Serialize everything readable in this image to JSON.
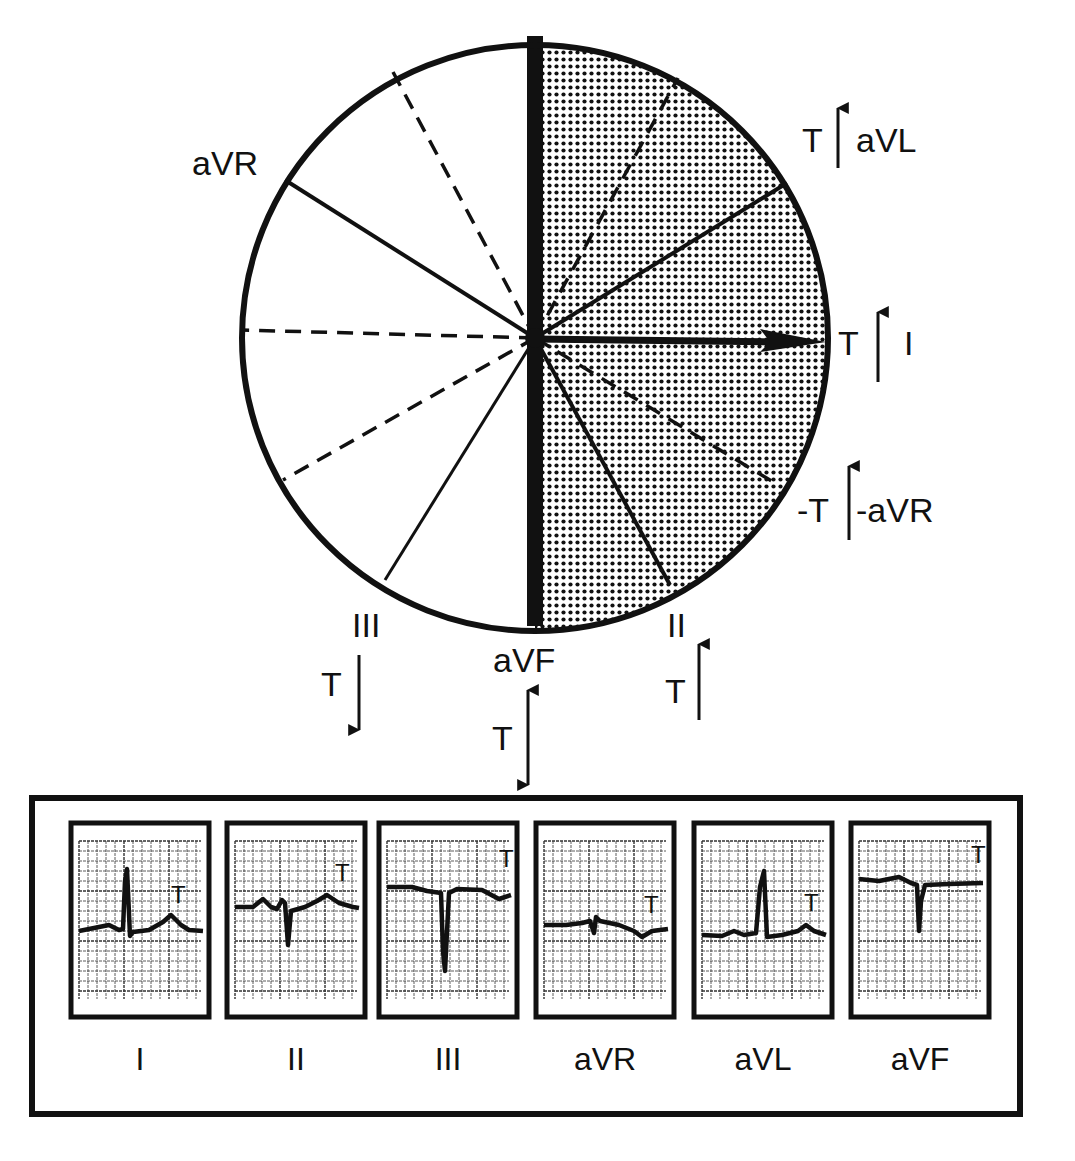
{
  "diagram": {
    "colors": {
      "ink": "#111111",
      "paper": "#ffffff",
      "shade_dot": "#111111"
    },
    "circle": {
      "cx": 535,
      "cy": 338,
      "r": 293
    },
    "shaded_half": "right",
    "axis_arrow": {
      "label": "T axis",
      "direction_deg": 0
    },
    "lead_lines": [
      {
        "name": "aVR",
        "style": "solid",
        "x": 285,
        "y": 180
      },
      {
        "name": "aVL",
        "style": "solid",
        "x": 787,
        "y": 183
      },
      {
        "name": "III",
        "style": "solid",
        "x": 385,
        "y": 580
      },
      {
        "name": "II",
        "style": "solid",
        "x": 670,
        "y": 585
      },
      {
        "name": "dash-upper-left",
        "style": "dashed",
        "x": 393,
        "y": 72
      },
      {
        "name": "dash-upper-right",
        "style": "dashed",
        "x": 678,
        "y": 78
      },
      {
        "name": "dash-left",
        "style": "dashed",
        "x": 242,
        "y": 330
      },
      {
        "name": "dash-lower-left",
        "style": "dashed",
        "x": 283,
        "y": 480
      },
      {
        "name": "dash-lower-right",
        "style": "dashed",
        "x": 778,
        "y": 485
      }
    ],
    "labels": {
      "aVR": "aVR",
      "aVL": "aVL",
      "I": "I",
      "neg_aVR": "-aVR",
      "II": "II",
      "III": "III",
      "aVF": "aVF",
      "T": "T",
      "neg_T": "-T"
    },
    "t_indicators": [
      {
        "lead": "aVL",
        "t_label": "T",
        "arrow": "up"
      },
      {
        "lead": "I",
        "t_label": "T",
        "arrow": "up"
      },
      {
        "lead": "-aVR",
        "t_label": "-T",
        "arrow": "up"
      },
      {
        "lead": "II",
        "t_label": "T",
        "arrow": "up"
      },
      {
        "lead": "aVF",
        "t_label": "T",
        "arrow": "both"
      },
      {
        "lead": "III",
        "t_label": "T",
        "arrow": "down"
      }
    ]
  },
  "strips": {
    "t_marker": "T",
    "items": [
      {
        "label": "I",
        "x": 71,
        "qrs": "upright",
        "t_wave": "upright"
      },
      {
        "label": "II",
        "x": 227,
        "qrs": "small-negative",
        "t_wave": "upright"
      },
      {
        "label": "III",
        "x": 379,
        "qrs": "deep-negative",
        "t_wave": "inverted"
      },
      {
        "label": "aVR",
        "x": 536,
        "qrs": "small-negative",
        "t_wave": "inverted"
      },
      {
        "label": "aVL",
        "x": 694,
        "qrs": "upright",
        "t_wave": "upright"
      },
      {
        "label": "aVF",
        "x": 851,
        "qrs": "negative",
        "t_wave": "flat"
      }
    ]
  }
}
